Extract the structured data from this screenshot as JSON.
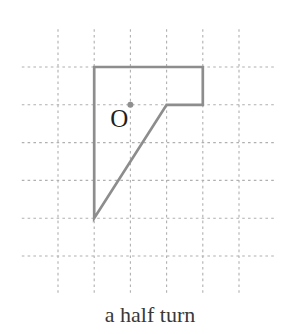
{
  "diagram": {
    "caption": "a half turn",
    "center_label": "O",
    "colors": {
      "background": "#ffffff",
      "grid": "#b0b0b0",
      "shape": "#8d8d8d",
      "dot": "#8f8f8f",
      "label": "#1f1f1f",
      "caption": "#383838"
    },
    "grid": {
      "origin_x": 21.8,
      "origin_y": 29.2,
      "cell_w": 36.2,
      "cell_h": 37.8,
      "cols": 7,
      "rows": 7
    },
    "shape_vertices_grid": [
      [
        2,
        1
      ],
      [
        5,
        1
      ],
      [
        5,
        2
      ],
      [
        4,
        2
      ],
      [
        2,
        5
      ]
    ],
    "center_grid": [
      3,
      2
    ]
  }
}
